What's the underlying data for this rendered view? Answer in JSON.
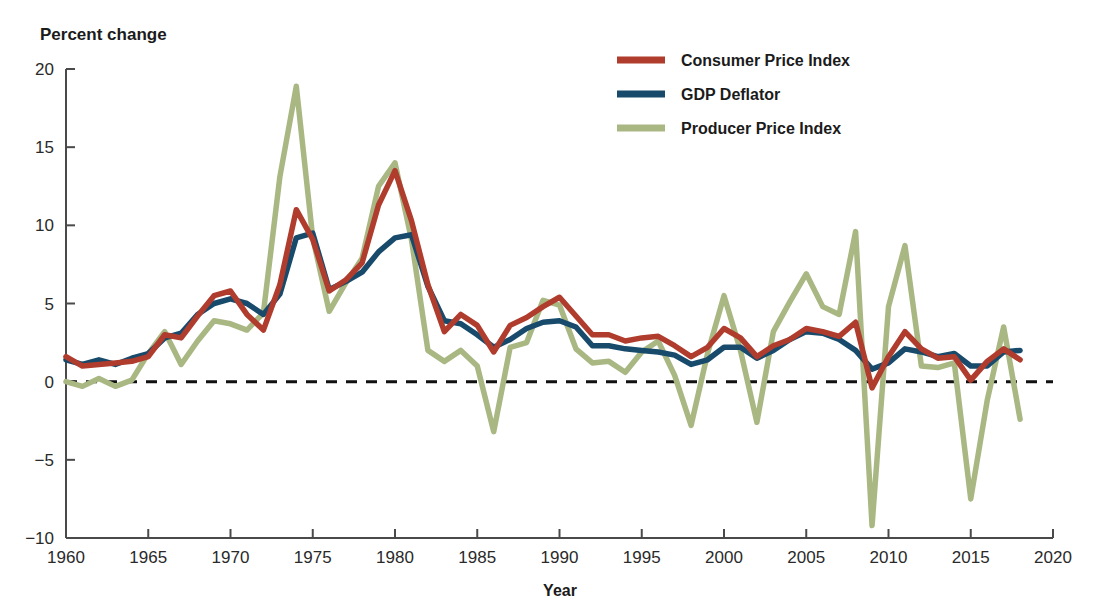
{
  "chart_data": {
    "type": "line",
    "title": "",
    "ylabel": "Percent change",
    "xlabel": "Year",
    "xlim": [
      1960,
      2020
    ],
    "ylim": [
      -10,
      20
    ],
    "yticks": [
      20,
      15,
      10,
      5,
      0,
      -5,
      -10
    ],
    "ytick_labels": [
      "20",
      "15",
      "10",
      "5",
      "0",
      "−5",
      "−10"
    ],
    "xticks": [
      1960,
      1965,
      1970,
      1975,
      1980,
      1985,
      1990,
      1995,
      2000,
      2005,
      2010,
      2015,
      2020
    ],
    "xtick_labels": [
      "1960",
      "1965",
      "1970",
      "1975",
      "1980",
      "1985",
      "1990",
      "1995",
      "2000",
      "2005",
      "2010",
      "2015",
      "2020"
    ],
    "grid": false,
    "zero_reference_line": 0,
    "legend_position": "top-center-right",
    "x": [
      1960,
      1961,
      1962,
      1963,
      1964,
      1965,
      1966,
      1967,
      1968,
      1969,
      1970,
      1971,
      1972,
      1973,
      1974,
      1975,
      1976,
      1977,
      1978,
      1979,
      1980,
      1981,
      1982,
      1983,
      1984,
      1985,
      1986,
      1987,
      1988,
      1989,
      1990,
      1991,
      1992,
      1993,
      1994,
      1995,
      1996,
      1997,
      1998,
      1999,
      2000,
      2001,
      2002,
      2003,
      2004,
      2005,
      2006,
      2007,
      2008,
      2009,
      2010,
      2011,
      2012,
      2013,
      2014,
      2015,
      2016,
      2017,
      2018
    ],
    "series": [
      {
        "name": "Consumer Price Index",
        "color": "#b03c2d",
        "values": [
          1.6,
          1.0,
          1.1,
          1.2,
          1.3,
          1.6,
          3.0,
          2.8,
          4.2,
          5.5,
          5.8,
          4.3,
          3.3,
          6.2,
          11.0,
          9.1,
          5.8,
          6.5,
          7.6,
          11.3,
          13.5,
          10.3,
          6.2,
          3.2,
          4.3,
          3.6,
          1.9,
          3.6,
          4.1,
          4.8,
          5.4,
          4.2,
          3.0,
          3.0,
          2.6,
          2.8,
          2.9,
          2.3,
          1.6,
          2.2,
          3.4,
          2.8,
          1.6,
          2.3,
          2.7,
          3.4,
          3.2,
          2.9,
          3.8,
          -0.4,
          1.6,
          3.2,
          2.1,
          1.5,
          1.6,
          0.1,
          1.3,
          2.1,
          1.4
        ]
      },
      {
        "name": "GDP Deflator",
        "color": "#174a6b",
        "values": [
          1.4,
          1.1,
          1.4,
          1.1,
          1.5,
          1.8,
          2.8,
          3.1,
          4.3,
          5.0,
          5.3,
          5.0,
          4.3,
          5.6,
          9.2,
          9.5,
          5.9,
          6.4,
          7.0,
          8.3,
          9.2,
          9.4,
          6.1,
          3.9,
          3.7,
          3.0,
          2.2,
          2.7,
          3.4,
          3.8,
          3.9,
          3.5,
          2.3,
          2.3,
          2.1,
          2.0,
          1.9,
          1.7,
          1.1,
          1.4,
          2.2,
          2.2,
          1.5,
          2.0,
          2.7,
          3.2,
          3.1,
          2.7,
          2.0,
          0.8,
          1.2,
          2.1,
          1.9,
          1.6,
          1.8,
          1.0,
          1.0,
          1.9,
          2.0
        ]
      },
      {
        "name": "Producer Price Index",
        "color": "#a9b783",
        "values": [
          0.0,
          -0.3,
          0.2,
          -0.3,
          0.1,
          1.8,
          3.2,
          1.1,
          2.6,
          3.9,
          3.7,
          3.3,
          4.4,
          13.1,
          18.9,
          9.2,
          4.5,
          6.3,
          7.9,
          12.5,
          14.0,
          9.1,
          2.0,
          1.3,
          2.0,
          1.0,
          -3.2,
          2.2,
          2.5,
          5.2,
          4.9,
          2.1,
          1.2,
          1.3,
          0.6,
          1.9,
          2.6,
          0.4,
          -2.8,
          1.8,
          5.5,
          2.0,
          -2.6,
          3.2,
          5.1,
          6.9,
          4.8,
          4.3,
          9.6,
          -9.2,
          4.8,
          8.7,
          1.0,
          0.9,
          1.2,
          -7.5,
          -1.2,
          3.5,
          -2.4
        ]
      }
    ]
  },
  "legend": {
    "items": [
      {
        "label": "Consumer Price Index",
        "color": "#b03c2d"
      },
      {
        "label": "GDP Deflator",
        "color": "#174a6b"
      },
      {
        "label": "Producer Price Index",
        "color": "#a9b783"
      }
    ]
  },
  "axes": {
    "y_title": "Percent change",
    "x_title": "Year"
  }
}
